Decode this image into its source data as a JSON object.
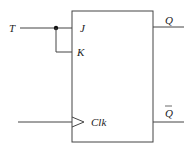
{
  "diagram": {
    "inputs": {
      "t": "T",
      "j": "J",
      "k": "K",
      "clk": "Clk"
    },
    "outputs": {
      "q": "Q",
      "qbar": "Q"
    },
    "colors": {
      "line": "#444444",
      "text": "#222222",
      "background": "#ffffff"
    }
  }
}
